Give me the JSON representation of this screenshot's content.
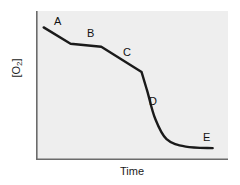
{
  "chart_data": {
    "type": "line",
    "title": "",
    "xlabel": "Time",
    "ylabel_text": "[O",
    "ylabel_sub": "2",
    "ylabel_tail": "]",
    "ylabel": "[O2]",
    "grid": false,
    "legend": "none",
    "axis_ticks": "none",
    "xlim": [
      0,
      100
    ],
    "ylim": [
      0,
      100
    ],
    "series": [
      {
        "name": "oxygen concentration",
        "color": "#1a1a1a",
        "x": [
          4,
          18,
          34,
          55,
          55,
          58,
          62,
          68,
          78,
          92
        ],
        "y": [
          89,
          78,
          76,
          59,
          59,
          46,
          28,
          14,
          9,
          8
        ]
      }
    ],
    "annotations": [
      {
        "label": "A",
        "x": 12,
        "y": 93
      },
      {
        "label": "B",
        "x": 30,
        "y": 86
      },
      {
        "label": "C",
        "x": 50,
        "y": 69
      },
      {
        "label": "D",
        "x": 66,
        "y": 38
      },
      {
        "label": "E",
        "x": 92,
        "y": 17
      }
    ],
    "colors": {
      "plot_background": "#eeeeee",
      "figure_background": "#ffffff",
      "axis": "#6b6b6b",
      "line": "#1a1a1a",
      "text": "#111111"
    }
  }
}
